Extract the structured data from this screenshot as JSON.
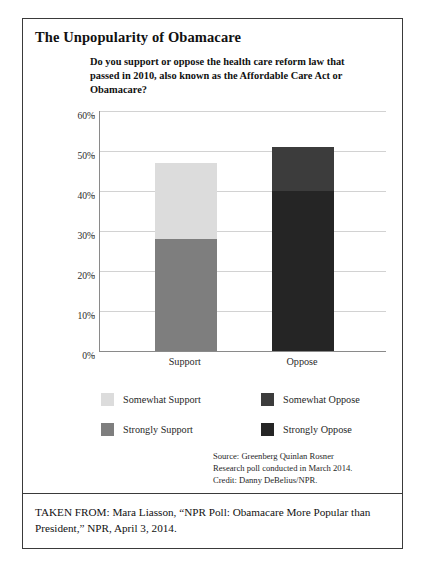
{
  "figure": {
    "title": "The Unpopularity of Obamacare",
    "question": "Do you support or oppose the health care reform law that passed in 2010, also known as the Affordable Care Act or Obamacare?",
    "source_line_1": "Source: Greenberg Quinlan Rosner",
    "source_line_2": "Research poll conducted in March 2014.",
    "source_line_3": "Credit: Danny DeBelius/NPR.",
    "footer": "TAKEN FROM: Mara Liasson, “NPR Poll: Obamacare More Popular than President,” NPR, April 3, 2014."
  },
  "chart_data": {
    "type": "bar",
    "stacked": true,
    "title": "Do you support or oppose the health care reform law that passed in 2010, also known as the Affordable Care Act or Obamacare?",
    "xlabel": "",
    "ylabel": "",
    "categories": [
      "Support",
      "Oppose"
    ],
    "ylim": [
      0,
      60
    ],
    "ytick_labels": [
      "0%",
      "10%",
      "20%",
      "30%",
      "40%",
      "50%",
      "60%"
    ],
    "ytick_values": [
      0,
      10,
      20,
      30,
      40,
      50,
      60
    ],
    "grid": true,
    "legend_position": "below",
    "series": [
      {
        "name": "Strongly Support",
        "category": "Support",
        "value": 28,
        "color": "#7e7e7e"
      },
      {
        "name": "Somewhat Support",
        "category": "Support",
        "value": 19,
        "color": "#dcdcdc"
      },
      {
        "name": "Strongly Oppose",
        "category": "Oppose",
        "value": 40,
        "color": "#252525"
      },
      {
        "name": "Somewhat Oppose",
        "category": "Oppose",
        "value": 11,
        "color": "#3c3c3c"
      }
    ],
    "totals": [
      47,
      51
    ],
    "legend": [
      {
        "label": "Somewhat Support",
        "color": "#dcdcdc"
      },
      {
        "label": "Strongly Support",
        "color": "#7e7e7e"
      },
      {
        "label": "Somewhat Oppose",
        "color": "#3c3c3c"
      },
      {
        "label": "Strongly Oppose",
        "color": "#252525"
      }
    ]
  }
}
